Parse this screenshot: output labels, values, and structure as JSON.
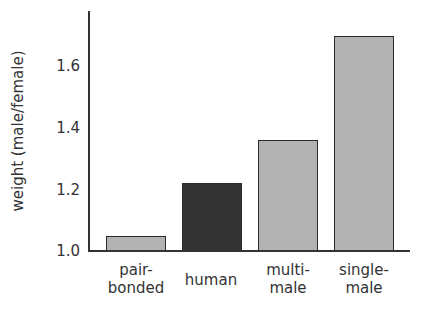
{
  "chart_data": {
    "type": "bar",
    "title": "",
    "xlabel": "",
    "ylabel": "weight (male/female)",
    "categories": [
      "pair-bonded",
      "human",
      "multi-male",
      "single-male"
    ],
    "category_labels": [
      [
        "pair-",
        "bonded"
      ],
      [
        "human"
      ],
      [
        "multi-",
        "male"
      ],
      [
        "single-",
        "male"
      ]
    ],
    "values": [
      1.05,
      1.22,
      1.36,
      1.7
    ],
    "colors": [
      "#b3b3b3",
      "#333333",
      "#b3b3b3",
      "#b3b3b3"
    ],
    "yticks": [
      "1.0",
      "1.2",
      "1.4",
      "1.6"
    ],
    "ylim": [
      1.0,
      1.78
    ],
    "grid": false,
    "legend": null
  }
}
